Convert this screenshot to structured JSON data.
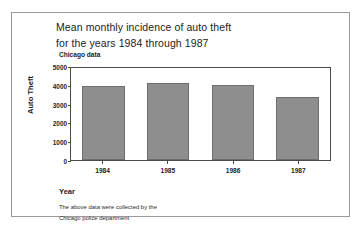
{
  "figure": {
    "title_lines": [
      "Mean monthly incidence of auto theft",
      "for the years 1984 through 1987"
    ],
    "subtitle": "Chicago data",
    "xaxis_title": "Year",
    "notes": [
      "The above data were collected by the",
      "Chicago police department"
    ],
    "bar_color": "#8e8e8e",
    "bar_border_color": "#6e6e6e",
    "frame_color": "#4a4a4a"
  },
  "chart_data": {
    "type": "bar",
    "title": "Mean monthly incidence of auto theft for the years 1984 through 1987",
    "subtitle": "Chicago data",
    "xlabel": "Year",
    "ylabel": "Auto Theft",
    "categories": [
      "1984",
      "1985",
      "1986",
      "1987"
    ],
    "values": [
      4000,
      4200,
      4100,
      3400
    ],
    "ylim": [
      0,
      5000
    ],
    "yticks": [
      5000,
      4000,
      3000,
      2000,
      1000,
      0
    ],
    "ytick_labels": [
      "5000",
      "4000",
      "3000",
      "2000",
      "1000",
      "0"
    ],
    "grid": false,
    "legend": false,
    "annotations": [
      "The above data were collected by the",
      "Chicago police department"
    ]
  }
}
